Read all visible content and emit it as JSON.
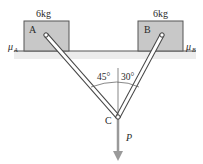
{
  "blocks": [
    {
      "id": "A",
      "label": "A",
      "mass": "6kg",
      "friction": "μ",
      "friction_sub": "A"
    },
    {
      "id": "B",
      "label": "B",
      "mass": "6kg",
      "friction": "μ",
      "friction_sub": "B"
    }
  ],
  "joint": {
    "label": "C"
  },
  "load": {
    "label": "P"
  },
  "angles": {
    "left": "45°",
    "right": "30°"
  },
  "colors": {
    "block_fill": "#c8c8c8",
    "block_stroke": "#555555",
    "floor_band": "#ececec",
    "rod_stroke": "#444444",
    "arrow": "#9a9a9a"
  }
}
